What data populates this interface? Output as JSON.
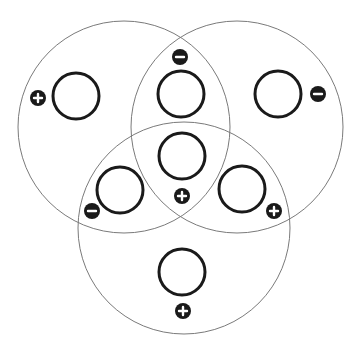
{
  "diagram": {
    "type": "venn-3",
    "colors": {
      "background": "#ffffff",
      "big_circle_stroke": "#7a7a7a",
      "small_circle_stroke": "#1a1a1a",
      "badge_fill": "#1a1a1a",
      "badge_symbol": "#ffffff"
    },
    "sets": [
      {
        "id": "left",
        "cx": 124,
        "cy": 127,
        "r": 106
      },
      {
        "id": "right",
        "cx": 237,
        "cy": 127,
        "r": 106
      },
      {
        "id": "bottom",
        "cx": 184,
        "cy": 228,
        "r": 106
      }
    ],
    "regions": [
      {
        "id": "left-only",
        "cx": 76,
        "cy": 96,
        "r": 23,
        "sign": "plus",
        "bx": 38,
        "by": 98
      },
      {
        "id": "left-right",
        "cx": 181,
        "cy": 94,
        "r": 23,
        "sign": "minus",
        "bx": 180,
        "by": 57
      },
      {
        "id": "right-only",
        "cx": 278,
        "cy": 94,
        "r": 23,
        "sign": "minus",
        "bx": 318,
        "by": 94
      },
      {
        "id": "center-all",
        "cx": 182,
        "cy": 156,
        "r": 23,
        "sign": "plus",
        "bx": 182,
        "by": 196
      },
      {
        "id": "left-bottom",
        "cx": 120,
        "cy": 190,
        "r": 23,
        "sign": "minus",
        "bx": 92,
        "by": 211
      },
      {
        "id": "right-bottom",
        "cx": 242,
        "cy": 189,
        "r": 23,
        "sign": "plus",
        "bx": 274,
        "by": 211
      },
      {
        "id": "bottom-only",
        "cx": 182,
        "cy": 272,
        "r": 23,
        "sign": "plus",
        "bx": 183,
        "by": 311
      }
    ],
    "badge_radius": 8
  }
}
